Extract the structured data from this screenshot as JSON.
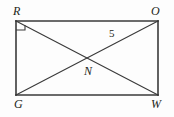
{
  "figure": {
    "type": "geometry-diagram",
    "shape": "rectangle-with-diagonals",
    "background_color": "#fdfdfd",
    "stroke_color": "#3a3a3a",
    "text_color": "#231f20"
  },
  "vertices": {
    "top_left": {
      "name": "R",
      "label": "R",
      "x": 16,
      "y": 21
    },
    "top_right": {
      "name": "O",
      "label": "O",
      "x": 158,
      "y": 21
    },
    "bottom_left": {
      "name": "G",
      "label": "G",
      "x": 16,
      "y": 95
    },
    "bottom_right": {
      "name": "W",
      "label": "W",
      "x": 158,
      "y": 95
    }
  },
  "intersection": {
    "name": "N",
    "label": "N",
    "x": 87,
    "y": 58
  },
  "segments": [
    {
      "name": "side-RO",
      "from": "R",
      "to": "O"
    },
    {
      "name": "side-OW",
      "from": "O",
      "to": "W"
    },
    {
      "name": "side-WG",
      "from": "W",
      "to": "G"
    },
    {
      "name": "side-GR",
      "from": "G",
      "to": "R"
    },
    {
      "name": "diagonal-RW",
      "from": "R",
      "to": "W"
    },
    {
      "name": "diagonal-GO",
      "from": "G",
      "to": "O"
    }
  ],
  "measures": [
    {
      "name": "segment-ON-length",
      "label": "5",
      "on_segment": "diagonal-GO",
      "x": 109,
      "y": 28
    }
  ],
  "markers": [
    {
      "name": "right-angle-at-R",
      "type": "right-angle-square",
      "at_vertex": "R",
      "size": 8
    }
  ]
}
